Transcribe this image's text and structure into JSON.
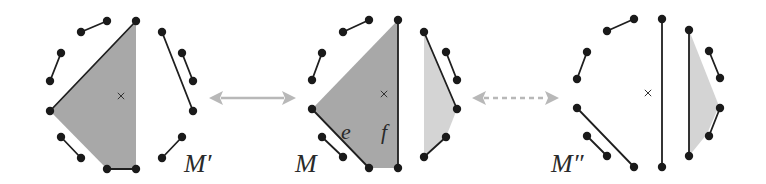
{
  "figure": {
    "width": 766,
    "height": 184,
    "colors": {
      "dot": "#1a1a1a",
      "edge": "#1f1f1f",
      "shade_dark": "#a8a8a8",
      "shade_light": "#d4d4d4",
      "arrow": "#b8b8b8",
      "mark": "#333333"
    }
  },
  "panels": [
    {
      "id": "M-prime",
      "label": "M′",
      "label_pos": [
        184,
        172
      ],
      "center_mark": [
        121,
        96
      ],
      "dots": [
        [
          136,
          21
        ],
        [
          107,
          21
        ],
        [
          81,
          32
        ],
        [
          61,
          53
        ],
        [
          50,
          81
        ],
        [
          50,
          111
        ],
        [
          61,
          137
        ],
        [
          81,
          158
        ],
        [
          107,
          169
        ],
        [
          136,
          169
        ],
        [
          162,
          32
        ],
        [
          182,
          53
        ],
        [
          193,
          81
        ],
        [
          193,
          111
        ],
        [
          182,
          137
        ],
        [
          162,
          158
        ]
      ],
      "edges": [
        [
          [
            107,
            21
          ],
          [
            81,
            32
          ]
        ],
        [
          [
            61,
            53
          ],
          [
            50,
            81
          ]
        ],
        [
          [
            136,
            21
          ],
          [
            50,
            111
          ]
        ],
        [
          [
            61,
            137
          ],
          [
            81,
            158
          ]
        ],
        [
          [
            107,
            169
          ],
          [
            136,
            169
          ]
        ],
        [
          [
            162,
            32
          ],
          [
            193,
            111
          ]
        ],
        [
          [
            182,
            53
          ],
          [
            193,
            81
          ]
        ],
        [
          [
            182,
            137
          ],
          [
            162,
            158
          ]
        ]
      ],
      "shaded": [
        {
          "tone": "dark",
          "points": [
            [
              136,
              21
            ],
            [
              50,
              111
            ],
            [
              107,
              169
            ],
            [
              136,
              169
            ]
          ]
        }
      ],
      "edge_labels": []
    },
    {
      "id": "M",
      "label": "M",
      "label_pos": [
        295,
        172
      ],
      "center_mark": [
        384,
        94
      ],
      "dots": [
        [
          398,
          20
        ],
        [
          369,
          20
        ],
        [
          343,
          32
        ],
        [
          322,
          53
        ],
        [
          312,
          80
        ],
        [
          312,
          109
        ],
        [
          322,
          137
        ],
        [
          343,
          157
        ],
        [
          369,
          168
        ],
        [
          398,
          168
        ],
        [
          424,
          32
        ],
        [
          446,
          52
        ],
        [
          457,
          80
        ],
        [
          457,
          109
        ],
        [
          446,
          137
        ],
        [
          424,
          157
        ]
      ],
      "edges": [
        [
          [
            369,
            20
          ],
          [
            343,
            32
          ]
        ],
        [
          [
            322,
            53
          ],
          [
            312,
            80
          ]
        ],
        [
          [
            312,
            109
          ],
          [
            369,
            168
          ]
        ],
        [
          [
            322,
            137
          ],
          [
            343,
            157
          ]
        ],
        [
          [
            398,
            20
          ],
          [
            398,
            168
          ]
        ],
        [
          [
            424,
            32
          ],
          [
            457,
            109
          ]
        ],
        [
          [
            446,
            52
          ],
          [
            457,
            80
          ]
        ],
        [
          [
            446,
            137
          ],
          [
            424,
            157
          ]
        ]
      ],
      "shaded": [
        {
          "tone": "dark",
          "points": [
            [
              398,
              20
            ],
            [
              312,
              109
            ],
            [
              369,
              168
            ],
            [
              398,
              168
            ]
          ]
        },
        {
          "tone": "light",
          "points": [
            [
              424,
              32
            ],
            [
              457,
              109
            ],
            [
              446,
              137
            ],
            [
              424,
              157
            ]
          ]
        }
      ],
      "edge_labels": [
        {
          "text": "e",
          "pos": [
            341,
            139
          ]
        },
        {
          "text": "f",
          "pos": [
            381,
            139
          ]
        }
      ]
    },
    {
      "id": "M-double-prime",
      "label": "M″",
      "label_pos": [
        551,
        172
      ],
      "center_mark": [
        648,
        93
      ],
      "dots": [
        [
          662,
          19
        ],
        [
          634,
          19
        ],
        [
          607,
          31
        ],
        [
          587,
          52
        ],
        [
          577,
          79
        ],
        [
          577,
          108
        ],
        [
          587,
          136
        ],
        [
          607,
          156
        ],
        [
          634,
          167
        ],
        [
          662,
          167
        ],
        [
          689,
          30
        ],
        [
          709,
          51
        ],
        [
          720,
          78
        ],
        [
          720,
          108
        ],
        [
          709,
          136
        ],
        [
          689,
          156
        ]
      ],
      "edges": [
        [
          [
            634,
            19
          ],
          [
            607,
            31
          ]
        ],
        [
          [
            587,
            52
          ],
          [
            577,
            79
          ]
        ],
        [
          [
            577,
            108
          ],
          [
            634,
            167
          ]
        ],
        [
          [
            587,
            136
          ],
          [
            607,
            156
          ]
        ],
        [
          [
            662,
            19
          ],
          [
            662,
            167
          ]
        ],
        [
          [
            689,
            30
          ],
          [
            689,
            156
          ]
        ],
        [
          [
            709,
            51
          ],
          [
            720,
            78
          ]
        ],
        [
          [
            720,
            108
          ],
          [
            709,
            136
          ]
        ]
      ],
      "shaded": [
        {
          "tone": "light",
          "points": [
            [
              689,
              30
            ],
            [
              719,
              106
            ],
            [
              707,
              134
            ],
            [
              689,
              156
            ]
          ]
        }
      ],
      "edge_labels": []
    }
  ],
  "arrows": [
    {
      "id": "arrow-mprime-m",
      "from": [
        209,
        98
      ],
      "to": [
        296,
        98
      ],
      "style": "solid",
      "double_headed": true
    },
    {
      "id": "arrow-m-mdoubleprime",
      "from": [
        472,
        98
      ],
      "to": [
        559,
        98
      ],
      "style": "dashed",
      "double_headed": true
    }
  ]
}
